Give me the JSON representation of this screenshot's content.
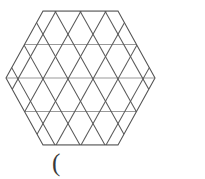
{
  "figure": {
    "caption_text": "(",
    "colors": {
      "background": "#ffffff",
      "horizontal_line": "#9a9a9a",
      "diagonal_line": "#5a5a5a",
      "outline": "#555555",
      "caption": "#3a3a3a"
    },
    "geometry": {
      "shape": "regular-hexagon",
      "orientation": "pointy-left-right",
      "center_x": 81,
      "center_y": 78,
      "circumradius": 75,
      "subdivision_order": 2,
      "triangle_count": 24,
      "cell_width": 25,
      "row_height": 33.5,
      "horizontal_line_y_values": [
        11,
        44.5,
        78,
        111.5,
        145
      ],
      "vertices_hexagon": [
        [
          6,
          78
        ],
        [
          43,
          11
        ],
        [
          118,
          11
        ],
        [
          155,
          78
        ],
        [
          118,
          145
        ],
        [
          43,
          145
        ]
      ],
      "row_endpoints": [
        {
          "y": 11,
          "x1": 43,
          "x2": 118
        },
        {
          "y": 44.5,
          "x1": 24.5,
          "x2": 136.5
        },
        {
          "y": 78,
          "x1": 6,
          "x2": 155
        },
        {
          "y": 111.5,
          "x1": 24.5,
          "x2": 136.5
        },
        {
          "y": 145,
          "x1": 43,
          "x2": 118
        }
      ],
      "diagonals_down_right": [
        {
          "x1": 43,
          "y1": 11,
          "x2": 118,
          "y2": 145
        },
        {
          "x1": 24.5,
          "y1": 44.5,
          "x2": 118,
          "y2": 211
        },
        {
          "x1": 68,
          "y1": 11,
          "x2": 143,
          "y2": 145
        },
        {
          "x1": 93,
          "y1": 11,
          "x2": 168,
          "y2": 145
        },
        {
          "x1": 6,
          "y1": 78,
          "x2": 43,
          "y2": 145
        },
        {
          "x1": 24.5,
          "y1": 44.5,
          "x2": 81,
          "y2": 145
        },
        {
          "x1": 118,
          "y1": 11,
          "x2": 155,
          "y2": 78
        }
      ],
      "diagonals_down_left": [
        {
          "x1": 118,
          "y1": 11,
          "x2": 43,
          "y2": 145
        },
        {
          "x1": 93,
          "y1": 11,
          "x2": 24.5,
          "y2": 133
        },
        {
          "x1": 68,
          "y1": 11,
          "x2": 6,
          "y2": 121
        },
        {
          "x1": 43,
          "y1": 11,
          "x2": 6,
          "y2": 78
        },
        {
          "x1": 155,
          "y1": 78,
          "x2": 118,
          "y2": 145
        },
        {
          "x1": 136.5,
          "y1": 44.5,
          "x2": 81,
          "y2": 145
        },
        {
          "x1": 136.5,
          "y1": 111.5,
          "x2": 118,
          "y2": 145
        }
      ]
    }
  }
}
